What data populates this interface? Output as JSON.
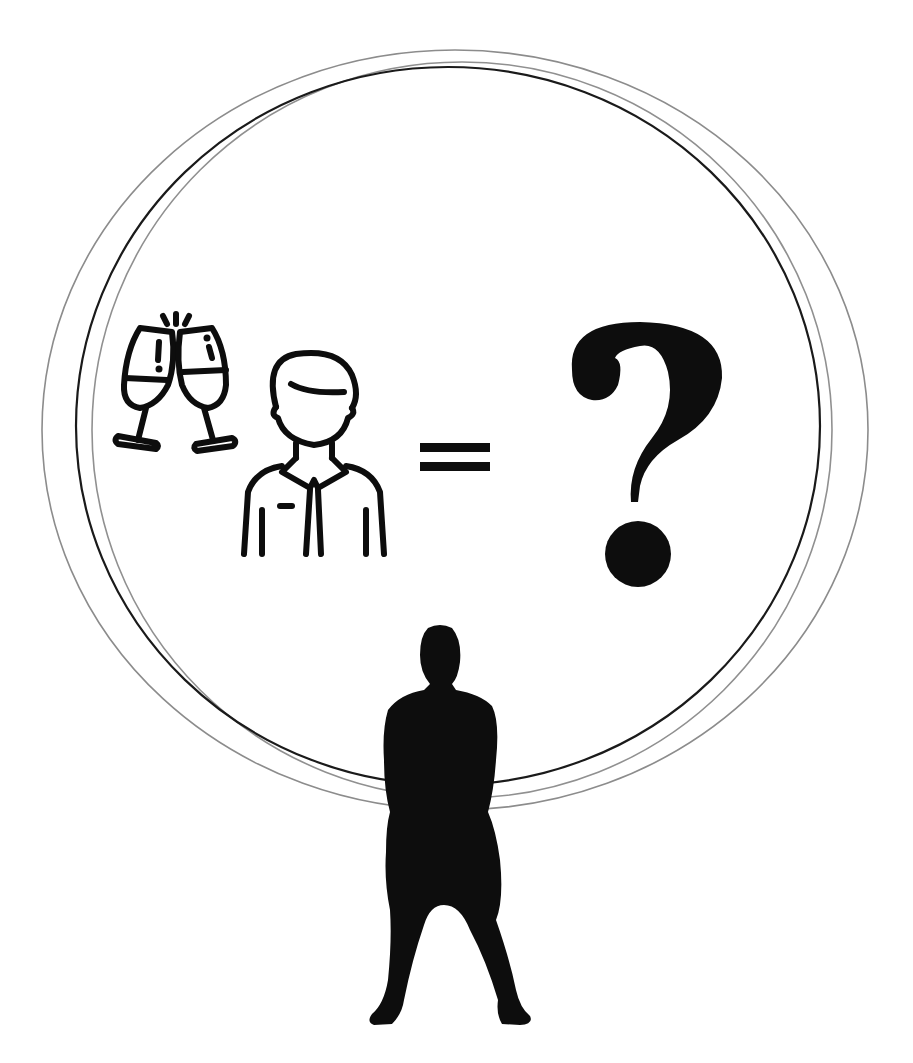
{
  "illustration": {
    "equation": {
      "left_terms": [
        {
          "icon": "champagne-toast-icon",
          "label": "Celebration / toast"
        },
        {
          "icon": "man-in-suit-icon",
          "label": "Person"
        }
      ],
      "operator": "=",
      "result": "?"
    },
    "figure": {
      "icon": "standing-person-silhouette",
      "label": "Silhouette of standing person"
    },
    "frame": {
      "shape": "overlapping-circles",
      "count": 3
    },
    "colors": {
      "ink": "#0d0d0d",
      "ring_dark": "#1a1a1a",
      "ring_light": "#8c8c8c",
      "background": "#ffffff"
    }
  }
}
